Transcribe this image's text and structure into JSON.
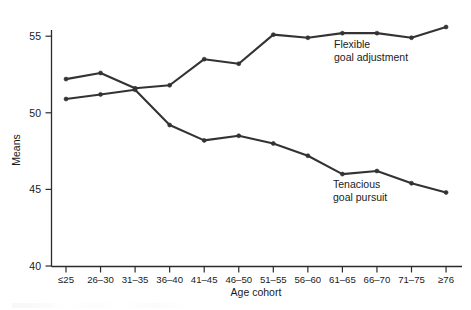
{
  "chart_data": {
    "type": "line",
    "title": "",
    "xlabel": "Age cohort",
    "ylabel": "Means",
    "categories": [
      "≤25",
      "26–30",
      "31–35",
      "36–40",
      "41–45",
      "46–50",
      "51–55",
      "56–60",
      "61–65",
      "66–70",
      "71–75",
      "≥76"
    ],
    "ylim": [
      40,
      55.8
    ],
    "yticks": [
      40,
      45,
      50,
      55
    ],
    "ytick_labels": [
      "40",
      "45",
      "50",
      "55"
    ],
    "grid": false,
    "legend_position": "inline-annotations",
    "series": [
      {
        "name": "Flexible goal adjustment",
        "color": "#333333",
        "values": [
          52.2,
          52.6,
          51.6,
          51.8,
          53.5,
          53.2,
          55.1,
          54.9,
          55.2,
          55.2,
          54.9,
          55.6
        ]
      },
      {
        "name": "Tenacious goal pursuit",
        "color": "#333333",
        "values": [
          50.9,
          51.2,
          51.5,
          49.2,
          48.2,
          48.5,
          48.0,
          47.2,
          46.0,
          46.2,
          45.4,
          44.8
        ]
      }
    ],
    "annotations": [
      {
        "id": "flexible-annotation",
        "line1": "Flexible",
        "line2": "goal adjustment",
        "x": 334,
        "y": 48
      },
      {
        "id": "tenacious-annotation",
        "line1": "Tenacious",
        "line2": "goal pursuit",
        "x": 333,
        "y": 188
      }
    ]
  }
}
